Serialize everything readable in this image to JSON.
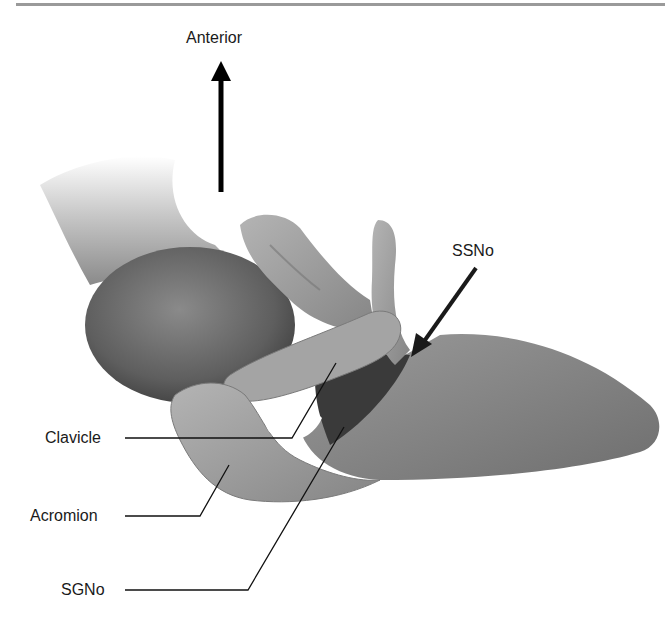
{
  "figure": {
    "labels": {
      "anterior": "Anterior",
      "ssno": "SSNo",
      "clavicle": "Clavicle",
      "acromion": "Acromion",
      "sgno": "SGNo"
    },
    "colors": {
      "bone_light": "#a8a8a8",
      "bone_mid": "#8c8c8c",
      "bone_dark": "#5e5e5e",
      "notch_dark": "#3a3a3a",
      "humeral_head": "#6a6a6a",
      "line": "#111111",
      "top_rule": "#9a9a9a"
    }
  }
}
